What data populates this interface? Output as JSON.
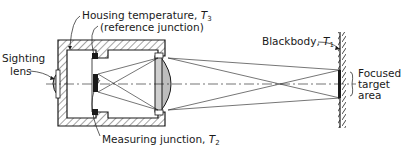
{
  "labels": {
    "housing": "Housing temperature, ",
    "housing_sym": "T",
    "housing_sub": "3",
    "reference": "(reference junction)",
    "sighting_1": "Sighting",
    "sighting_2": "lens",
    "measuring": "Measuring junction, ",
    "measuring_sym": "T",
    "measuring_sub": "2",
    "blackbody": "Blackbody, ",
    "blackbody_sym": "T",
    "blackbody_sub": "1",
    "focused_1": "Focused",
    "focused_2": "target",
    "focused_3": "area"
  },
  "colors": {
    "ink": "#1a1a1a",
    "lens_fill": "#bdbdbd"
  }
}
